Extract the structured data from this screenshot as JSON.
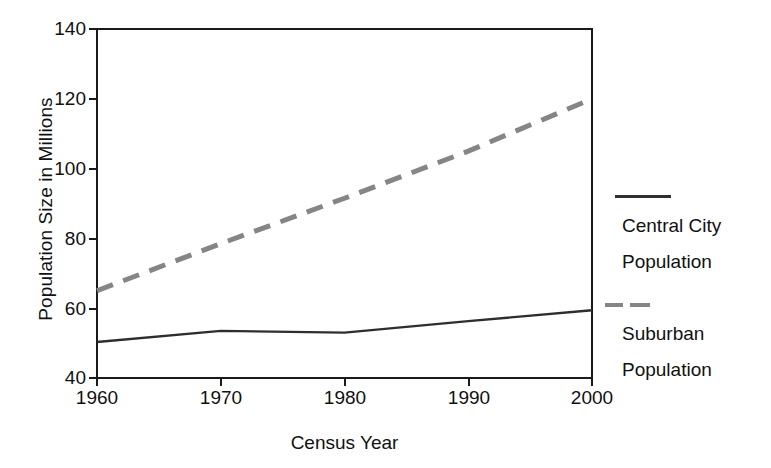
{
  "chart_data": {
    "type": "line",
    "title": "",
    "xlabel": "Census Year",
    "ylabel": "Population Size in Millions",
    "x": [
      1960,
      1970,
      1980,
      1990,
      2000
    ],
    "xtick_labels": [
      "1960",
      "1970",
      "1980",
      "1990",
      "2000"
    ],
    "ytick_labels": [
      "40",
      "60",
      "80",
      "100",
      "120",
      "140"
    ],
    "yticks": [
      40,
      60,
      80,
      100,
      120,
      140
    ],
    "xlim": [
      1960,
      2000
    ],
    "ylim": [
      40,
      140
    ],
    "grid": false,
    "legend_position": "right",
    "series": [
      {
        "name": "Central City Population",
        "name_line1": "Central City",
        "name_line2": "Population",
        "style": "solid",
        "color": "#2e2e2e",
        "values": [
          50.3,
          53.5,
          53.0,
          56.3,
          59.4
        ]
      },
      {
        "name": "Suburban Population",
        "name_line1": "Suburban",
        "name_line2": "Population",
        "style": "dashed",
        "color": "#858585",
        "values": [
          65.0,
          78.5,
          91.5,
          105.0,
          120.0
        ]
      }
    ]
  },
  "axis": {
    "y_title": "Population Size in Millions",
    "x_title": "Census Year",
    "y_ticks": [
      "140",
      "120",
      "100",
      "80",
      "60",
      "40"
    ],
    "x_ticks": [
      "1960",
      "1970",
      "1980",
      "1990",
      "2000"
    ]
  },
  "legend": {
    "entries": [
      {
        "line1": "Central City",
        "line2": "Population",
        "marker": "solid-line-swatch"
      },
      {
        "line1": "Suburban",
        "line2": "Population",
        "marker": "dashed-line-swatch"
      }
    ]
  },
  "colors": {
    "axis": "#1a1a1a",
    "central_city": "#2e2e2e",
    "suburban": "#858585",
    "background": "#ffffff"
  }
}
